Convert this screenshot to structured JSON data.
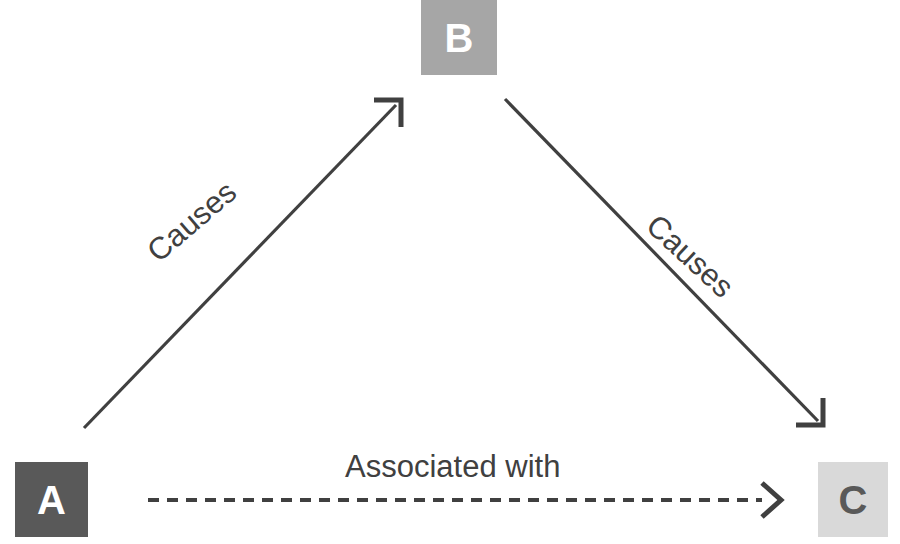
{
  "diagram": {
    "background_color": "#ffffff",
    "nodes": [
      {
        "id": "A",
        "label": "A",
        "fill": "#595959",
        "text_color": "#ffffff"
      },
      {
        "id": "B",
        "label": "B",
        "fill": "#a6a6a6",
        "text_color": "#ffffff"
      },
      {
        "id": "C",
        "label": "C",
        "fill": "#d9d9d9",
        "text_color": "#595959"
      }
    ],
    "edges": [
      {
        "id": "a-to-b",
        "from": "A",
        "to": "B",
        "label": "Causes",
        "style": "solid",
        "arrowhead": "open-chevron",
        "color": "#404040"
      },
      {
        "id": "b-to-c",
        "from": "B",
        "to": "C",
        "label": "Causes",
        "style": "solid",
        "arrowhead": "open-chevron",
        "color": "#404040"
      },
      {
        "id": "a-to-c",
        "from": "A",
        "to": "C",
        "label": "Associated with",
        "style": "dashed",
        "arrowhead": "open-chevron",
        "color": "#404040"
      }
    ]
  }
}
